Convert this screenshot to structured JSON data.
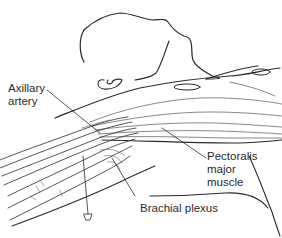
{
  "figure": {
    "labels": {
      "axillary_artery_line1": "Axillary",
      "axillary_artery_line2": "artery",
      "pectoralis_line1": "Pectoralis",
      "pectoralis_line2": "major",
      "pectoralis_line3": "muscle",
      "brachial_plexus": "Brachial plexus"
    },
    "colors": {
      "line": "#2a2a2a",
      "hatch": "#555555",
      "background": "#ffffff"
    }
  }
}
